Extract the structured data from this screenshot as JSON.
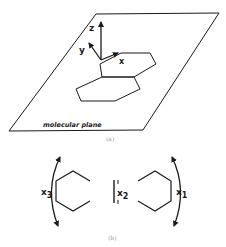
{
  "panel_a": {
    "caption": "(a)",
    "plane_label": "molecular plane",
    "axes": {
      "x": "x",
      "y": "y",
      "z": "z"
    }
  },
  "panel_b": {
    "caption": "(b)",
    "modes": {
      "x1": {
        "base": "x",
        "sub": "1"
      },
      "x2": {
        "base": "x",
        "sub": "2"
      },
      "x3": {
        "base": "x",
        "sub": "3"
      }
    }
  },
  "colors": {
    "ink": "#1a1a1a",
    "caption": "#999999",
    "background": "#ffffff"
  }
}
